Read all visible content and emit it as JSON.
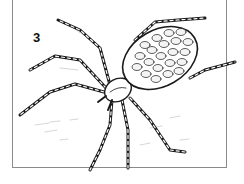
{
  "figure": {
    "label": "3",
    "line_color": "#1a1a1a",
    "frame_color": "#8a8a8a"
  }
}
